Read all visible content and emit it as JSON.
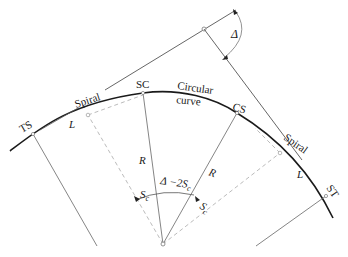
{
  "diagram": {
    "type": "spiral-curve-geometry",
    "points": {
      "ts": "TS",
      "sc": "SC",
      "cs": "CS",
      "st": "ST"
    },
    "segments": {
      "spiral_left": "Spiral",
      "circular_line1": "Circular",
      "circular_line2": "curve",
      "spiral_right": "Spiral"
    },
    "symbols": {
      "spiral_length_left": "L",
      "spiral_length_right": "L",
      "radius_left": "R",
      "radius_right": "R",
      "deflection_angle": "Δ",
      "central_left_S": "S",
      "central_left_sub": "c",
      "central_middle_prefix": "Δ",
      "central_middle_mid": " −2S",
      "central_middle_sub": "c",
      "central_right_S": "S",
      "central_right_sub": "c"
    },
    "colors": {
      "line": "#1a1a1a",
      "thin_line": "#555555",
      "dashed_line": "#aaaaaa"
    }
  }
}
